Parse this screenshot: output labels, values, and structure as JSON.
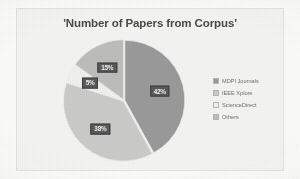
{
  "chart_data": {
    "type": "pie",
    "title": "'Number of Papers from Corpus'",
    "labels": [
      "MDPI Journals",
      "IEEE Xplore",
      "ScienceDirect",
      "Others"
    ],
    "values": [
      42,
      38,
      5,
      15
    ],
    "value_labels": [
      "42%",
      "38%",
      "5%",
      "15%"
    ],
    "colors": [
      "#9a9a9a",
      "#cbcbc9",
      "#f0f0ee",
      "#bdbdbb"
    ],
    "legend_position": "right",
    "grid": false,
    "xlabel": "",
    "ylabel": ""
  },
  "legend": {
    "items": [
      {
        "label": "MDPI Journals",
        "color": "#9a9a9a"
      },
      {
        "label": "IEEE Xplore",
        "color": "#cbcbc9"
      },
      {
        "label": "ScienceDirect",
        "color": "#f0f0ee"
      },
      {
        "label": "Others",
        "color": "#bdbdbb"
      }
    ]
  }
}
